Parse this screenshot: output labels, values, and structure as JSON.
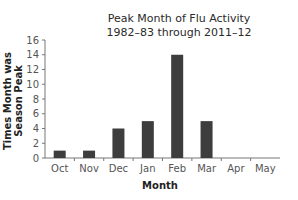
{
  "chart_data": {
    "type": "bar",
    "title": "Peak Month of Flu Activity",
    "subtitle": "1982–83 through 2011–12",
    "xlabel": "Month",
    "ylabel": "Times Month was Season Peak",
    "categories": [
      "Oct",
      "Nov",
      "Dec",
      "Jan",
      "Feb",
      "Mar",
      "Apr",
      "May"
    ],
    "values": [
      1,
      1,
      4,
      5,
      14,
      5,
      0,
      0
    ],
    "ylim": [
      0,
      16
    ],
    "yticks": [
      0,
      2,
      4,
      6,
      8,
      10,
      12,
      14,
      16
    ],
    "grid": false,
    "legend": null,
    "bar_color": "#3d3d3d"
  }
}
